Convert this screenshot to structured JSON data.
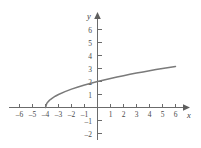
{
  "figure": {
    "background_color": "#ffffff",
    "axis_color": "#6b6b6b",
    "curve_color": "#7a7a7a",
    "label_color": "#4a4a4a",
    "x_axis_name": "x",
    "y_axis_name": "y"
  },
  "chart_data": {
    "type": "line",
    "title": "",
    "subtitle": "",
    "xlabel": "x",
    "ylabel": "y",
    "xlim": [
      -6.8,
      6.8
    ],
    "ylim": [
      -2.6,
      6.6
    ],
    "grid": false,
    "legend": null,
    "x_ticks": [
      -6,
      -5,
      -4,
      -3,
      -2,
      -1,
      1,
      2,
      3,
      4,
      5,
      6
    ],
    "x_tick_labels": [
      "–6",
      "–5",
      "–4",
      "–3",
      "–2",
      "–1",
      "1",
      "2",
      "3",
      "4",
      "5",
      "6"
    ],
    "y_ticks": [
      -2,
      -1,
      1,
      2,
      3,
      4,
      5,
      6
    ],
    "y_tick_labels": [
      "–2",
      "–1",
      "1",
      "2",
      "3",
      "4",
      "5",
      "6"
    ],
    "series": [
      {
        "name": "y = sqrt(x + 4)",
        "x": [
          -4,
          -3.9,
          -3.8,
          -3.7,
          -3.6,
          -3.5,
          -3.25,
          -3,
          -2.5,
          -2,
          -1.5,
          -1,
          -0.5,
          0,
          0.5,
          1,
          1.5,
          2,
          2.5,
          3,
          3.5,
          4,
          4.5,
          5,
          5.5,
          6
        ],
        "values": [
          0,
          0.316,
          0.447,
          0.548,
          0.632,
          0.707,
          0.866,
          1,
          1.225,
          1.414,
          1.581,
          1.732,
          1.871,
          2,
          2.121,
          2.236,
          2.345,
          2.449,
          2.55,
          2.646,
          2.739,
          2.828,
          2.915,
          3,
          3.082,
          3.162
        ],
        "endpoints": {
          "left": [
            -4,
            0
          ],
          "right": [
            6,
            3.162
          ]
        }
      }
    ],
    "annotations": []
  }
}
